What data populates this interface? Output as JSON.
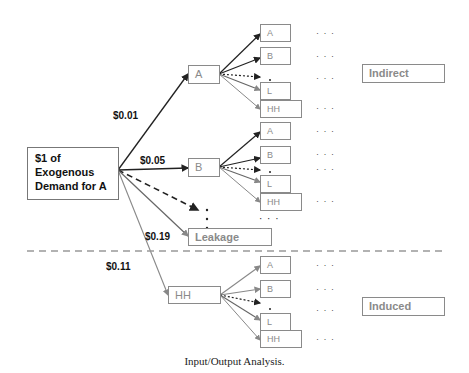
{
  "diagram": {
    "source": {
      "label": "$1 of Exogenous Demand for A"
    },
    "source_lines": [
      "$1 of",
      "Exogenous",
      "Demand for A"
    ],
    "first_tier": {
      "A": {
        "label": "A",
        "amount": "$0.01"
      },
      "B": {
        "label": "B",
        "amount": "$0.05"
      },
      "leakage": {
        "label": "Leakage",
        "amount": "$0.19"
      },
      "HH": {
        "label": "HH",
        "amount": "$0.11"
      }
    },
    "second_tier_labels": [
      "A",
      "B",
      "L",
      "HH"
    ],
    "continuation": "· · ·",
    "categories": {
      "indirect": "Indirect",
      "induced": "Induced"
    }
  },
  "caption": "Input/Output Analysis."
}
